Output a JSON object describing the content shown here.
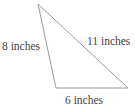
{
  "figure": {
    "kind": "geometry-diagram",
    "shape": "triangle",
    "background_color": "#ffffff",
    "stroke_color": "#9a9a9a",
    "stroke_width": 1,
    "text_color": "#3f3f3f",
    "unit": "inches",
    "vertices": [
      {
        "name": "apex",
        "x": 38,
        "y": 4
      },
      {
        "name": "bottom-left",
        "x": 56,
        "y": 88
      },
      {
        "name": "bottom-right",
        "x": 128,
        "y": 88
      }
    ],
    "sides": [
      {
        "id": "left",
        "label": "8 inches",
        "value": 8,
        "from": "apex",
        "to": "bottom-left"
      },
      {
        "id": "hypotenuse",
        "label": "11 inches",
        "value": 11,
        "from": "apex",
        "to": "bottom-right"
      },
      {
        "id": "base",
        "label": "6 inches",
        "value": 6,
        "from": "bottom-left",
        "to": "bottom-right"
      }
    ]
  }
}
